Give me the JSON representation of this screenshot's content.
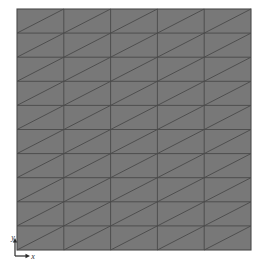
{
  "figure": {
    "type": "mesh-diagram",
    "background_color": "#ffffff"
  },
  "mesh": {
    "name": "triangulated-square-mesh",
    "element_type": "triangle",
    "diagonal_direction": "bottom-left-to-top-right",
    "columns": 5,
    "rows": 10,
    "quad_cells": 50,
    "triangle_elements": 100,
    "fill_color": "#787878",
    "line_color": "#4a4a4a",
    "border_color": "#4a4a4a",
    "line_width": 0.9,
    "border_width": 1.1,
    "bounds": {
      "left": 17,
      "top": 9,
      "right": 251,
      "bottom": 250,
      "width": 234,
      "height": 241
    },
    "cell_width": 46.8,
    "cell_height": 24.1
  },
  "axes_triad": {
    "name": "coordinate-axes-indicator",
    "origin": {
      "x": 15,
      "y": 256
    },
    "color": "#2b2b2b",
    "x_axis": {
      "label": "x",
      "label_x": 33,
      "label_y": 259,
      "tip_x": 30,
      "tip_y": 256,
      "direction": "right"
    },
    "y_axis": {
      "label": "y",
      "label_x": 13,
      "label_y": 240,
      "tip_x": 15,
      "tip_y": 238,
      "direction": "up"
    }
  }
}
